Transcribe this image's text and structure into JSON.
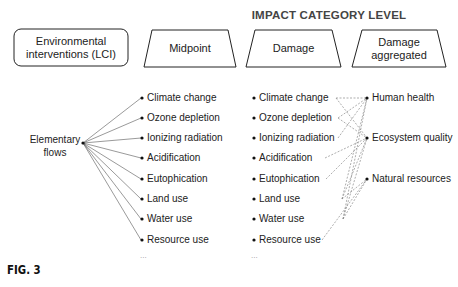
{
  "title": "IMPACT CATEGORY LEVEL",
  "header_boxes": {
    "lci": "Environmental interventions (LCI)",
    "midpoint": "Midpoint",
    "damage": "Damage",
    "damage_aggregated": "Damage aggregated"
  },
  "elementary_flows": "Elementary flows",
  "midpoint_items": [
    "Climate change",
    "Ozone depletion",
    "Ionizing radiation",
    "Acidification",
    "Eutophication",
    "Land use",
    "Water use",
    "Resource use"
  ],
  "damage_items": [
    "Climate change",
    "Ozone depletion",
    "Ionizing radiation",
    "Acidification",
    "Eutophication",
    "Land use",
    "Water use",
    "Resource use"
  ],
  "aggregated_items": [
    "Human health",
    "Ecosystem quality",
    "Natural resources"
  ],
  "ellipsis": "...",
  "figure_label": "FIG. 3"
}
